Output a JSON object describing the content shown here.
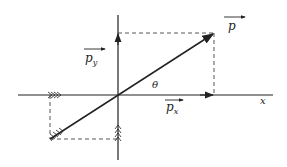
{
  "diagram": {
    "type": "vector-decomposition",
    "labels": {
      "vector": "p",
      "y_component": "p",
      "y_subscript": "y",
      "x_component": "p",
      "x_subscript": "x",
      "angle": "θ",
      "x_axis": "x"
    },
    "colors": {
      "line": "#222222",
      "dashed": "#444444",
      "background": "#ffffff"
    },
    "geometry": {
      "origin": [
        118,
        95
      ],
      "vector_tip": [
        214,
        33
      ],
      "vector_tail": [
        50,
        139
      ],
      "x_axis_range": [
        18,
        273
      ],
      "y_axis_range": [
        15,
        160
      ]
    }
  }
}
